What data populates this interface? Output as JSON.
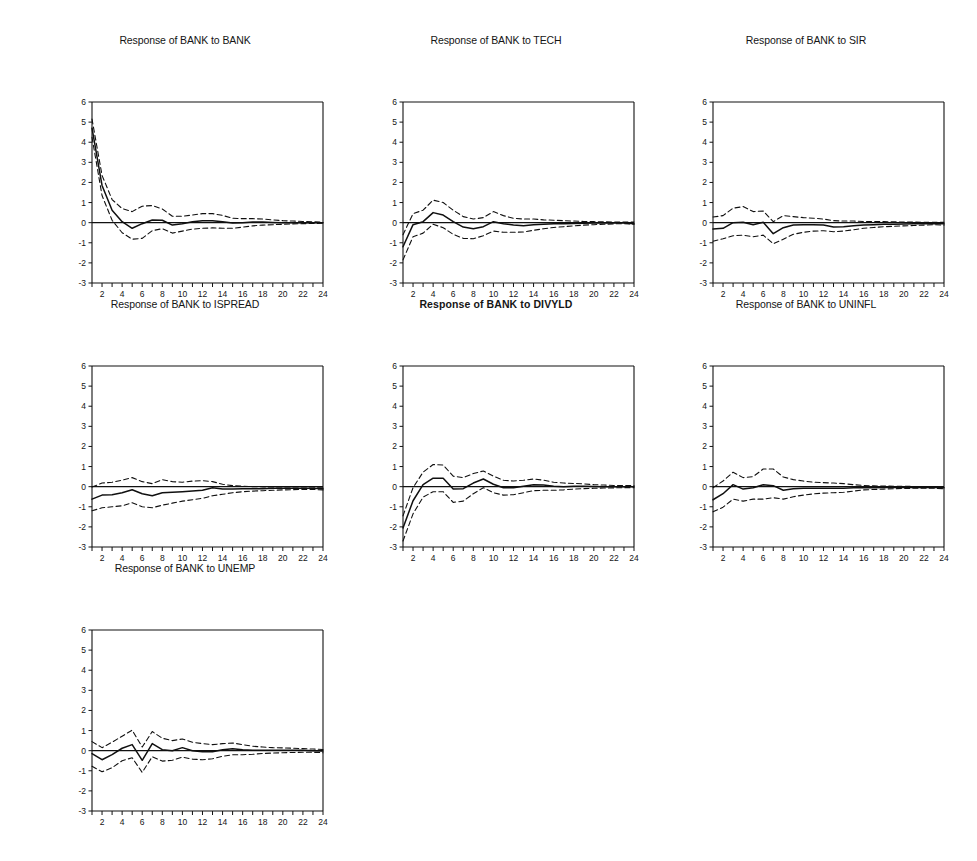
{
  "figure": {
    "kind": "impulse-response-grid",
    "rows": 3,
    "columns": 3,
    "background": "#ffffff",
    "line_color": "#101010",
    "solid_style": "solid",
    "band_style": "dashed"
  },
  "axis": {
    "y_ticks": [
      "6",
      "5",
      "4",
      "3",
      "2",
      "1",
      "0",
      "-1",
      "-2",
      "-3"
    ],
    "x_ticks": [
      "2",
      "4",
      "6",
      "8",
      "10",
      "12",
      "14",
      "16",
      "18",
      "20",
      "22",
      "24"
    ],
    "ylim": [
      -3,
      6
    ],
    "xlim": [
      1,
      24
    ],
    "xlabel": "",
    "ylabel": "",
    "grid": false
  },
  "chart_data": [
    {
      "type": "line",
      "title": "Response of BANK to BANK",
      "title_bold": false,
      "xlabel": "",
      "ylabel": "",
      "xlim": [
        1,
        24
      ],
      "ylim": [
        -3,
        6
      ],
      "grid": false,
      "legend": "none",
      "x": [
        1,
        2,
        3,
        4,
        5,
        6,
        7,
        8,
        9,
        10,
        11,
        12,
        13,
        14,
        15,
        16,
        17,
        18,
        19,
        20,
        21,
        22,
        23,
        24
      ],
      "series": [
        {
          "name": "response",
          "style": "solid",
          "values": [
            4.7,
            1.85,
            0.62,
            0.05,
            -0.28,
            -0.05,
            0.13,
            0.12,
            -0.12,
            -0.05,
            0.05,
            0.1,
            0.1,
            0.04,
            -0.02,
            0.0,
            0.03,
            0.03,
            0.01,
            0.0,
            0.0,
            0.0,
            0.0,
            0.0
          ]
        },
        {
          "name": "upper-ci",
          "style": "dashed",
          "values": [
            5.15,
            2.35,
            1.15,
            0.7,
            0.55,
            0.82,
            0.85,
            0.68,
            0.32,
            0.32,
            0.38,
            0.45,
            0.45,
            0.36,
            0.22,
            0.2,
            0.2,
            0.18,
            0.14,
            0.1,
            0.08,
            0.06,
            0.04,
            0.03
          ]
        },
        {
          "name": "lower-ci",
          "style": "dashed",
          "values": [
            4.25,
            1.35,
            0.12,
            -0.5,
            -0.82,
            -0.78,
            -0.4,
            -0.3,
            -0.52,
            -0.42,
            -0.32,
            -0.28,
            -0.26,
            -0.28,
            -0.28,
            -0.22,
            -0.16,
            -0.12,
            -0.1,
            -0.08,
            -0.06,
            -0.05,
            -0.04,
            -0.03
          ]
        }
      ]
    },
    {
      "type": "line",
      "title": "Response of BANK to TECH",
      "title_bold": false,
      "xlabel": "",
      "ylabel": "",
      "xlim": [
        1,
        24
      ],
      "ylim": [
        -3,
        6
      ],
      "grid": false,
      "legend": "none",
      "x": [
        1,
        2,
        3,
        4,
        5,
        6,
        7,
        8,
        9,
        10,
        11,
        12,
        13,
        14,
        15,
        16,
        17,
        18,
        19,
        20,
        21,
        22,
        23,
        24
      ],
      "series": [
        {
          "name": "response",
          "style": "solid",
          "values": [
            -1.2,
            -0.1,
            0.05,
            0.5,
            0.38,
            0.05,
            -0.22,
            -0.3,
            -0.2,
            0.05,
            -0.05,
            -0.12,
            -0.15,
            -0.1,
            -0.08,
            -0.05,
            -0.05,
            -0.04,
            -0.03,
            -0.02,
            -0.02,
            -0.02,
            -0.02,
            -0.05
          ]
        },
        {
          "name": "upper-ci",
          "style": "dashed",
          "values": [
            -0.6,
            0.45,
            0.62,
            1.12,
            1.0,
            0.62,
            0.3,
            0.18,
            0.25,
            0.55,
            0.35,
            0.22,
            0.18,
            0.18,
            0.14,
            0.12,
            0.1,
            0.08,
            0.06,
            0.05,
            0.04,
            0.03,
            0.03,
            0.03
          ]
        },
        {
          "name": "lower-ci",
          "style": "dashed",
          "values": [
            -1.85,
            -0.7,
            -0.52,
            -0.08,
            -0.25,
            -0.58,
            -0.78,
            -0.8,
            -0.65,
            -0.42,
            -0.48,
            -0.48,
            -0.46,
            -0.38,
            -0.3,
            -0.24,
            -0.2,
            -0.16,
            -0.12,
            -0.1,
            -0.08,
            -0.06,
            -0.05,
            -0.08
          ]
        }
      ]
    },
    {
      "type": "line",
      "title": "Response of BANK to SIR",
      "title_bold": false,
      "xlabel": "",
      "ylabel": "",
      "xlim": [
        1,
        24
      ],
      "ylim": [
        -3,
        6
      ],
      "grid": false,
      "legend": "none",
      "x": [
        1,
        2,
        3,
        4,
        5,
        6,
        7,
        8,
        9,
        10,
        11,
        12,
        13,
        14,
        15,
        16,
        17,
        18,
        19,
        20,
        21,
        22,
        23,
        24
      ],
      "series": [
        {
          "name": "response",
          "style": "solid",
          "values": [
            -0.32,
            -0.28,
            0.0,
            0.02,
            -0.1,
            0.02,
            -0.55,
            -0.25,
            -0.12,
            -0.1,
            -0.1,
            -0.12,
            -0.22,
            -0.2,
            -0.15,
            -0.12,
            -0.1,
            -0.08,
            -0.08,
            -0.07,
            -0.06,
            -0.05,
            -0.05,
            -0.06
          ]
        },
        {
          "name": "upper-ci",
          "style": "dashed",
          "values": [
            0.28,
            0.35,
            0.72,
            0.8,
            0.55,
            0.58,
            0.05,
            0.35,
            0.3,
            0.25,
            0.22,
            0.18,
            0.1,
            0.08,
            0.08,
            0.06,
            0.05,
            0.05,
            0.04,
            0.03,
            0.03,
            0.02,
            0.02,
            0.02
          ]
        },
        {
          "name": "lower-ci",
          "style": "dashed",
          "values": [
            -0.92,
            -0.8,
            -0.65,
            -0.62,
            -0.7,
            -0.62,
            -1.05,
            -0.82,
            -0.58,
            -0.48,
            -0.42,
            -0.4,
            -0.45,
            -0.42,
            -0.35,
            -0.28,
            -0.24,
            -0.2,
            -0.18,
            -0.16,
            -0.14,
            -0.12,
            -0.1,
            -0.12
          ]
        }
      ]
    },
    {
      "type": "line",
      "title": "Response of BANK to ISPREAD",
      "title_bold": false,
      "xlabel": "",
      "ylabel": "",
      "xlim": [
        1,
        24
      ],
      "ylim": [
        -3,
        6
      ],
      "grid": false,
      "legend": "none",
      "x": [
        1,
        2,
        3,
        4,
        5,
        6,
        7,
        8,
        9,
        10,
        11,
        12,
        13,
        14,
        15,
        16,
        17,
        18,
        19,
        20,
        21,
        22,
        23,
        24
      ],
      "series": [
        {
          "name": "response",
          "style": "solid",
          "values": [
            -0.62,
            -0.42,
            -0.4,
            -0.3,
            -0.15,
            -0.35,
            -0.45,
            -0.3,
            -0.28,
            -0.25,
            -0.22,
            -0.18,
            -0.05,
            -0.12,
            -0.12,
            -0.1,
            -0.1,
            -0.1,
            -0.08,
            -0.08,
            -0.08,
            -0.08,
            -0.08,
            -0.1
          ]
        },
        {
          "name": "upper-ci",
          "style": "dashed",
          "values": [
            -0.02,
            0.18,
            0.22,
            0.32,
            0.45,
            0.25,
            0.15,
            0.35,
            0.25,
            0.22,
            0.28,
            0.3,
            0.25,
            0.12,
            0.05,
            0.02,
            0.0,
            -0.01,
            -0.02,
            -0.02,
            -0.02,
            -0.02,
            -0.02,
            -0.03
          ]
        },
        {
          "name": "lower-ci",
          "style": "dashed",
          "values": [
            -1.2,
            -1.05,
            -1.0,
            -0.95,
            -0.8,
            -1.0,
            -1.05,
            -0.92,
            -0.82,
            -0.72,
            -0.65,
            -0.58,
            -0.45,
            -0.38,
            -0.3,
            -0.25,
            -0.22,
            -0.2,
            -0.18,
            -0.16,
            -0.15,
            -0.14,
            -0.14,
            -0.16
          ]
        }
      ]
    },
    {
      "type": "line",
      "title": "Response of BANK to DIVYLD",
      "title_bold": true,
      "xlabel": "",
      "ylabel": "",
      "xlim": [
        1,
        24
      ],
      "ylim": [
        -3,
        6
      ],
      "grid": false,
      "legend": "none",
      "x": [
        1,
        2,
        3,
        4,
        5,
        6,
        7,
        8,
        9,
        10,
        11,
        12,
        13,
        14,
        15,
        16,
        17,
        18,
        19,
        20,
        21,
        22,
        23,
        24
      ],
      "series": [
        {
          "name": "response",
          "style": "solid",
          "values": [
            -2.05,
            -0.7,
            0.1,
            0.42,
            0.42,
            -0.12,
            -0.1,
            0.18,
            0.38,
            0.12,
            -0.05,
            -0.05,
            0.02,
            0.1,
            0.08,
            0.02,
            0.0,
            0.02,
            0.02,
            0.01,
            0.0,
            0.0,
            0.0,
            0.0
          ]
        },
        {
          "name": "upper-ci",
          "style": "dashed",
          "values": [
            -1.45,
            -0.05,
            0.72,
            1.1,
            1.08,
            0.52,
            0.45,
            0.65,
            0.78,
            0.52,
            0.32,
            0.28,
            0.32,
            0.38,
            0.32,
            0.22,
            0.18,
            0.16,
            0.14,
            0.1,
            0.08,
            0.06,
            0.05,
            0.05
          ]
        },
        {
          "name": "lower-ci",
          "style": "dashed",
          "values": [
            -2.7,
            -1.35,
            -0.52,
            -0.25,
            -0.25,
            -0.78,
            -0.72,
            -0.35,
            -0.05,
            -0.3,
            -0.42,
            -0.4,
            -0.3,
            -0.2,
            -0.18,
            -0.18,
            -0.16,
            -0.12,
            -0.1,
            -0.08,
            -0.07,
            -0.06,
            -0.05,
            -0.05
          ]
        }
      ]
    },
    {
      "type": "line",
      "title": "Response of BANK to UNINFL",
      "title_bold": false,
      "xlabel": "",
      "ylabel": "",
      "xlim": [
        1,
        24
      ],
      "ylim": [
        -3,
        6
      ],
      "grid": false,
      "legend": "none",
      "x": [
        1,
        2,
        3,
        4,
        5,
        6,
        7,
        8,
        9,
        10,
        11,
        12,
        13,
        14,
        15,
        16,
        17,
        18,
        19,
        20,
        21,
        22,
        23,
        24
      ],
      "series": [
        {
          "name": "response",
          "style": "solid",
          "values": [
            -0.65,
            -0.35,
            0.1,
            -0.12,
            -0.05,
            0.1,
            0.05,
            -0.18,
            -0.1,
            -0.08,
            -0.08,
            -0.08,
            -0.08,
            -0.08,
            -0.06,
            -0.05,
            -0.05,
            -0.04,
            -0.04,
            -0.04,
            -0.04,
            -0.04,
            -0.04,
            -0.05
          ]
        },
        {
          "name": "upper-ci",
          "style": "dashed",
          "values": [
            -0.05,
            0.28,
            0.72,
            0.45,
            0.5,
            0.88,
            0.88,
            0.48,
            0.35,
            0.28,
            0.22,
            0.2,
            0.18,
            0.15,
            0.1,
            0.06,
            0.04,
            0.03,
            0.02,
            0.02,
            0.01,
            0.01,
            0.01,
            0.01
          ]
        },
        {
          "name": "lower-ci",
          "style": "dashed",
          "values": [
            -1.25,
            -1.02,
            -0.62,
            -0.72,
            -0.62,
            -0.62,
            -0.55,
            -0.62,
            -0.5,
            -0.42,
            -0.36,
            -0.32,
            -0.3,
            -0.28,
            -0.22,
            -0.16,
            -0.14,
            -0.12,
            -0.1,
            -0.09,
            -0.08,
            -0.08,
            -0.08,
            -0.1
          ]
        }
      ]
    },
    {
      "type": "line",
      "title": "Response of BANK to UNEMP",
      "title_bold": false,
      "xlabel": "",
      "ylabel": "",
      "xlim": [
        1,
        24
      ],
      "ylim": [
        -3,
        6
      ],
      "grid": false,
      "legend": "none",
      "x": [
        1,
        2,
        3,
        4,
        5,
        6,
        7,
        8,
        9,
        10,
        11,
        12,
        13,
        14,
        15,
        16,
        17,
        18,
        19,
        20,
        21,
        22,
        23,
        24
      ],
      "series": [
        {
          "name": "response",
          "style": "solid",
          "values": [
            -0.15,
            -0.45,
            -0.2,
            0.12,
            0.3,
            -0.48,
            0.35,
            0.05,
            0.0,
            0.15,
            0.0,
            -0.05,
            -0.05,
            0.05,
            0.1,
            0.05,
            0.02,
            0.02,
            0.02,
            0.02,
            0.02,
            0.02,
            0.0,
            -0.02
          ]
        },
        {
          "name": "upper-ci",
          "style": "dashed",
          "values": [
            0.45,
            0.15,
            0.42,
            0.72,
            1.02,
            0.18,
            0.95,
            0.62,
            0.5,
            0.58,
            0.42,
            0.35,
            0.3,
            0.35,
            0.38,
            0.3,
            0.22,
            0.18,
            0.15,
            0.14,
            0.12,
            0.1,
            0.08,
            0.06
          ]
        },
        {
          "name": "lower-ci",
          "style": "dashed",
          "values": [
            -0.78,
            -1.05,
            -0.85,
            -0.5,
            -0.35,
            -1.08,
            -0.3,
            -0.52,
            -0.48,
            -0.32,
            -0.42,
            -0.45,
            -0.4,
            -0.28,
            -0.2,
            -0.2,
            -0.18,
            -0.14,
            -0.12,
            -0.1,
            -0.09,
            -0.08,
            -0.08,
            -0.1
          ]
        }
      ]
    }
  ]
}
